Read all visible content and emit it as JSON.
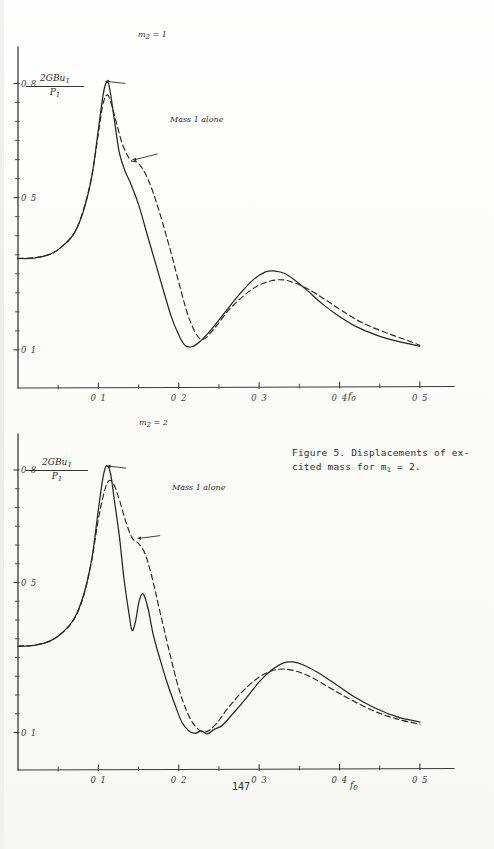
{
  "page": {
    "page_number": "147",
    "caption": "Figure 5.  Displacements of ex-\ncited mass for m1 = 2.",
    "caption_line1": "Figure 5.  Displacements of ex-",
    "caption_line2_pre": "cited mass for m",
    "caption_line2_sub": "1",
    "caption_line2_post": " = 2."
  },
  "figures": [
    {
      "id": "top-chart",
      "ylabel_num": "2GBu",
      "ylabel_num_sub": "1",
      "ylabel_den": "P",
      "ylabel_den_sub": "1",
      "xlabel": "f",
      "xlabel_sub": "0",
      "curve_label": "m2 = 1",
      "curve_label_pre": "m",
      "curve_label_sub": "2",
      "curve_label_post": " = 1",
      "dashed_label": "Mass 1 alone",
      "ytick_labels": [
        "0.8",
        "0.5",
        "0.1"
      ],
      "xtick_labels": [
        "0.1",
        "0.2",
        "0.3",
        "0.4",
        "0.5"
      ]
    },
    {
      "id": "bottom-chart",
      "ylabel_num": "2GBu",
      "ylabel_num_sub": "1",
      "ylabel_den": "P",
      "ylabel_den_sub": "1",
      "xlabel": "f",
      "xlabel_sub": "0",
      "curve_label": "m2 = 2",
      "curve_label_pre": "m",
      "curve_label_sub": "2",
      "curve_label_post": " = 2",
      "dashed_label": "Mass 1 alone",
      "ytick_labels": [
        "0.8",
        "0.5",
        "0.1"
      ],
      "xtick_labels": [
        "0.1",
        "0.2",
        "0.3",
        "0.4",
        "0.5"
      ]
    }
  ],
  "chart_data": [
    {
      "type": "line",
      "title": "Displacements of excited mass for m1 = 2, m2 = 1",
      "xlabel": "f0",
      "ylabel": "2GBu1/P1",
      "xlim": [
        0,
        0.52
      ],
      "ylim": [
        0.0,
        0.88
      ],
      "xticks": [
        0.1,
        0.2,
        0.3,
        0.4,
        0.5
      ],
      "yticks": [
        0.1,
        0.5,
        0.8
      ],
      "grid": false,
      "legend": "annotations",
      "annotations": [
        {
          "text": "m2 = 1",
          "x": 0.135,
          "y": 0.8,
          "target_x": 0.108,
          "target_y": 0.805
        },
        {
          "text": "Mass 1 alone",
          "x": 0.175,
          "y": 0.615,
          "target_x": 0.142,
          "target_y": 0.6
        }
      ],
      "series": [
        {
          "name": "m2 = 1",
          "style": "solid",
          "x": [
            0.0,
            0.02,
            0.04,
            0.055,
            0.07,
            0.082,
            0.092,
            0.1,
            0.106,
            0.11,
            0.114,
            0.12,
            0.126,
            0.133,
            0.14,
            0.15,
            0.162,
            0.175,
            0.19,
            0.2,
            0.208,
            0.216,
            0.226,
            0.24,
            0.258,
            0.275,
            0.292,
            0.308,
            0.32,
            0.332,
            0.345,
            0.36,
            0.378,
            0.398,
            0.42,
            0.445,
            0.47,
            0.5
          ],
          "y": [
            0.34,
            0.342,
            0.352,
            0.372,
            0.408,
            0.47,
            0.56,
            0.68,
            0.77,
            0.805,
            0.79,
            0.7,
            0.62,
            0.57,
            0.538,
            0.48,
            0.395,
            0.3,
            0.19,
            0.138,
            0.112,
            0.108,
            0.122,
            0.152,
            0.2,
            0.245,
            0.283,
            0.305,
            0.308,
            0.3,
            0.282,
            0.255,
            0.222,
            0.19,
            0.162,
            0.14,
            0.124,
            0.11
          ]
        },
        {
          "name": "Mass 1 alone",
          "style": "dashed",
          "x": [
            0.0,
            0.02,
            0.04,
            0.055,
            0.07,
            0.082,
            0.092,
            0.1,
            0.106,
            0.111,
            0.116,
            0.122,
            0.13,
            0.14,
            0.15,
            0.162,
            0.175,
            0.19,
            0.202,
            0.214,
            0.228,
            0.245,
            0.262,
            0.28,
            0.298,
            0.315,
            0.33,
            0.345,
            0.362,
            0.382,
            0.405,
            0.43,
            0.458,
            0.488,
            0.5
          ],
          "y": [
            0.34,
            0.342,
            0.352,
            0.372,
            0.408,
            0.47,
            0.56,
            0.672,
            0.748,
            0.77,
            0.748,
            0.7,
            0.64,
            0.6,
            0.59,
            0.548,
            0.47,
            0.36,
            0.262,
            0.178,
            0.128,
            0.16,
            0.205,
            0.24,
            0.268,
            0.282,
            0.284,
            0.276,
            0.258,
            0.232,
            0.2,
            0.17,
            0.145,
            0.122,
            0.112
          ]
        }
      ]
    },
    {
      "type": "line",
      "title": "Displacements of excited mass for m1 = 2, m2 = 2",
      "xlabel": "f0",
      "ylabel": "2GBu1/P1",
      "xlim": [
        0,
        0.52
      ],
      "ylim": [
        0.0,
        0.88
      ],
      "xticks": [
        0.1,
        0.2,
        0.3,
        0.4,
        0.5
      ],
      "yticks": [
        0.1,
        0.5,
        0.8
      ],
      "grid": false,
      "legend": "annotations",
      "annotations": [
        {
          "text": "m2 = 2",
          "x": 0.136,
          "y": 0.805,
          "target_x": 0.11,
          "target_y": 0.81
        },
        {
          "text": "Mass 1 alone",
          "x": 0.178,
          "y": 0.625,
          "target_x": 0.148,
          "target_y": 0.618
        }
      ],
      "series": [
        {
          "name": "m2 = 2",
          "style": "solid",
          "x": [
            0.0,
            0.02,
            0.04,
            0.055,
            0.07,
            0.082,
            0.092,
            0.1,
            0.106,
            0.11,
            0.115,
            0.12,
            0.126,
            0.132,
            0.138,
            0.142,
            0.146,
            0.151,
            0.156,
            0.162,
            0.168,
            0.176,
            0.186,
            0.196,
            0.204,
            0.212,
            0.22,
            0.228,
            0.236,
            0.244,
            0.254,
            0.268,
            0.284,
            0.3,
            0.316,
            0.33,
            0.342,
            0.356,
            0.372,
            0.392,
            0.416,
            0.444,
            0.472,
            0.5
          ],
          "y": [
            0.33,
            0.333,
            0.344,
            0.366,
            0.404,
            0.468,
            0.566,
            0.69,
            0.78,
            0.812,
            0.79,
            0.72,
            0.62,
            0.512,
            0.42,
            0.372,
            0.395,
            0.452,
            0.47,
            0.43,
            0.362,
            0.3,
            0.23,
            0.168,
            0.128,
            0.105,
            0.098,
            0.104,
            0.096,
            0.108,
            0.12,
            0.152,
            0.192,
            0.234,
            0.268,
            0.285,
            0.288,
            0.28,
            0.262,
            0.234,
            0.198,
            0.166,
            0.142,
            0.128
          ]
        },
        {
          "name": "Mass 1 alone",
          "style": "dashed",
          "x": [
            0.0,
            0.02,
            0.04,
            0.055,
            0.07,
            0.082,
            0.092,
            0.1,
            0.107,
            0.113,
            0.119,
            0.126,
            0.134,
            0.142,
            0.15,
            0.158,
            0.166,
            0.176,
            0.188,
            0.2,
            0.21,
            0.22,
            0.232,
            0.246,
            0.262,
            0.28,
            0.298,
            0.315,
            0.33,
            0.346,
            0.364,
            0.386,
            0.412,
            0.442,
            0.472,
            0.5
          ],
          "y": [
            0.33,
            0.333,
            0.344,
            0.366,
            0.404,
            0.468,
            0.56,
            0.668,
            0.74,
            0.772,
            0.762,
            0.72,
            0.662,
            0.618,
            0.604,
            0.578,
            0.52,
            0.43,
            0.318,
            0.218,
            0.158,
            0.118,
            0.1,
            0.122,
            0.168,
            0.21,
            0.245,
            0.264,
            0.27,
            0.264,
            0.248,
            0.222,
            0.19,
            0.158,
            0.136,
            0.122
          ]
        }
      ]
    }
  ]
}
